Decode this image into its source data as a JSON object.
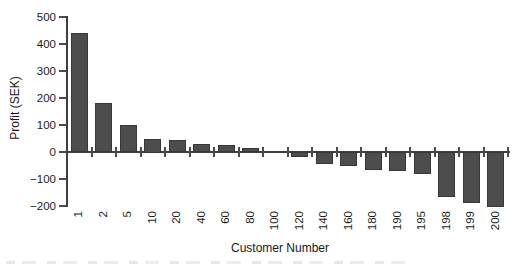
{
  "figure": {
    "y_axis": {
      "title": "Profit (SEK)",
      "tick_labels": [
        "500",
        "400",
        "300",
        "200",
        "100",
        "0",
        "−100",
        "−200"
      ]
    },
    "x_axis": {
      "title": "Customer Number"
    },
    "colors": {
      "bar_fill": "#4d4d4d",
      "bar_border": "#383838",
      "axis_line": "#3f3f3f",
      "text": "#1c1c1c"
    }
  },
  "chart_data": {
    "type": "bar",
    "title": "",
    "xlabel": "Customer Number",
    "ylabel": "Profit (SEK)",
    "categories": [
      "1",
      "2",
      "5",
      "10",
      "20",
      "40",
      "60",
      "80",
      "100",
      "120",
      "140",
      "160",
      "180",
      "190",
      "195",
      "198",
      "199",
      "200"
    ],
    "values": [
      440,
      180,
      100,
      50,
      45,
      30,
      25,
      15,
      0,
      -20,
      -45,
      -50,
      -65,
      -70,
      -80,
      -165,
      -190,
      -205
    ],
    "ylim": [
      -200,
      500
    ],
    "ytick_step": 100,
    "grid": false,
    "legend": false
  }
}
